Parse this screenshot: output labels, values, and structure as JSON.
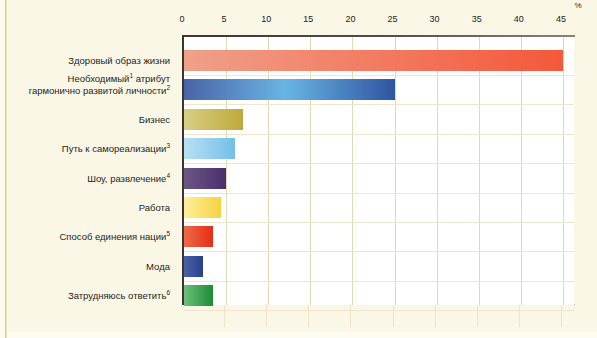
{
  "chart_data": {
    "type": "bar",
    "orientation": "horizontal",
    "title": "",
    "subtitle": "",
    "xlabel": "%",
    "ylabel": "",
    "xlim": [
      0,
      47
    ],
    "xticks": [
      0,
      5,
      10,
      15,
      20,
      25,
      30,
      35,
      40,
      45
    ],
    "xtick_labels": [
      "0",
      "5",
      "10",
      "15",
      "20",
      "25",
      "30",
      "35",
      "40",
      "45"
    ],
    "unit_symbol": "%",
    "grid": true,
    "grid_axis": "x",
    "legend": false,
    "categories": [
      "Здоровый образ жизни",
      "Необходимый¹ атрибут\nгармонично развитой личности²",
      "Бизнес",
      "Путь к самореализации³",
      "Шоу, развлечение⁴",
      "Работа",
      "Способ единения нации⁵",
      "Мода",
      "Затрудняюсь ответить⁶"
    ],
    "values": [
      45,
      25,
      7,
      6,
      5,
      4.4,
      3.5,
      2.3,
      3.5
    ]
  },
  "axis": {
    "percent_symbol": "%",
    "ticks": [
      {
        "label": "0",
        "value": 0
      },
      {
        "label": "5",
        "value": 5
      },
      {
        "label": "10",
        "value": 10
      },
      {
        "label": "15",
        "value": 15
      },
      {
        "label": "20",
        "value": 20
      },
      {
        "label": "25",
        "value": 25
      },
      {
        "label": "30",
        "value": 30
      },
      {
        "label": "35",
        "value": 35
      },
      {
        "label": "40",
        "value": 40
      },
      {
        "label": "45",
        "value": 45
      }
    ]
  },
  "bars": [
    {
      "label": "Здоровый образ жизни",
      "label_main": "Здоровый образ жизни",
      "superscript": "",
      "value": 45,
      "color_start": "#f0a08a",
      "color_end": "#f4583a"
    },
    {
      "label": "Необходимый¹ атрибут гармонично развитой личности²",
      "label_line1": "Необходимый",
      "label_line1_sup": "1",
      "label_line1_rest": " атрибут",
      "label_line2": "гармонично развитой личности",
      "label_line2_sup": "2",
      "value": 25,
      "color_start": "#4a63a8",
      "color_mid": "#69b4e4",
      "color_end": "#2f55a0"
    },
    {
      "label": "Бизнес",
      "label_main": "Бизнес",
      "superscript": "",
      "value": 7,
      "color_start": "#d8cf84",
      "color_end": "#bfa83c"
    },
    {
      "label": "Путь к самореализации³",
      "label_main": "Путь к самореализации",
      "superscript": "3",
      "value": 6,
      "color_start": "#b8e0f4",
      "color_end": "#74bfe8"
    },
    {
      "label": "Шоу, развлечение⁴",
      "label_main": "Шоу, развлечение",
      "superscript": "4",
      "value": 5,
      "color_start": "#6b5886",
      "color_end": "#4a2f6b"
    },
    {
      "label": "Работа",
      "label_main": "Работа",
      "superscript": "",
      "value": 4.4,
      "color_start": "#fdf09a",
      "color_end": "#f6d344"
    },
    {
      "label": "Способ единения нации⁵",
      "label_main": "Способ единения нации",
      "superscript": "5",
      "value": 3.5,
      "color_start": "#ef6a48",
      "color_end": "#e52d15"
    },
    {
      "label": "Мода",
      "label_main": "Мода",
      "superscript": "",
      "value": 2.3,
      "color_start": "#4a63a8",
      "color_end": "#29408c"
    },
    {
      "label": "Затрудняюсь ответить⁶",
      "label_main": "Затрудняюсь ответить",
      "superscript": "6",
      "value": 3.5,
      "color_start": "#6fbf7a",
      "color_end": "#1b8b36"
    }
  ],
  "colors": {
    "page_background": "#fbf7e6",
    "plot_background": "#ffffff",
    "gridline": "#e3d7b4",
    "axis_line": "#3a362f",
    "text": "#231f20"
  }
}
